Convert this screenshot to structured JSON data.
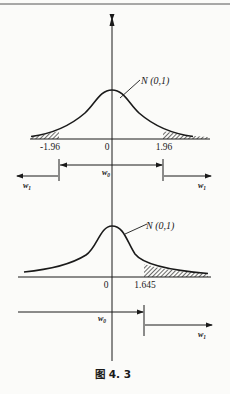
{
  "header_rule": true,
  "caption": "图 4. 3",
  "top_plot": {
    "distribution_label": "N (0,1)",
    "ticks": {
      "left": "-1.96",
      "center": "0",
      "right": "1.96"
    },
    "regions": {
      "acceptance": "w",
      "acceptance_sub": "0",
      "rejection_left": "w",
      "rejection_left_sub": "1",
      "rejection_right": "w",
      "rejection_right_sub": "1"
    }
  },
  "bottom_plot": {
    "distribution_label": "N (0,1)",
    "ticks": {
      "center": "0",
      "right": "1.645"
    },
    "regions": {
      "acceptance": "w",
      "acceptance_sub": "0",
      "rejection_right": "w",
      "rejection_right_sub": "1"
    }
  },
  "colors": {
    "ink": "#1a1a1a",
    "paper": "#fbfbf9"
  }
}
